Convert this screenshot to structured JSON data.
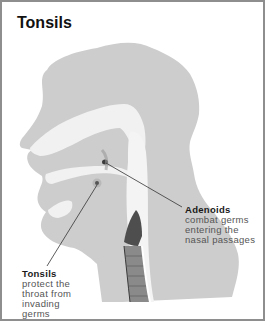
{
  "diagram": {
    "title": "Tonsils",
    "colors": {
      "head_fill": "#cdcdcd",
      "cavity_fill": "#f3f3f3",
      "airway_dark": "#5a5a5a",
      "border": "#8e8e8e",
      "leader_line": "#333333"
    },
    "labels": [
      {
        "id": "adenoids",
        "name": "Adenoids",
        "description": "combat germs\nentering the\nnasal passages"
      },
      {
        "id": "tonsils",
        "name": "Tonsils",
        "description": "protect the\nthroat from\ninvading\ngerms"
      }
    ]
  }
}
